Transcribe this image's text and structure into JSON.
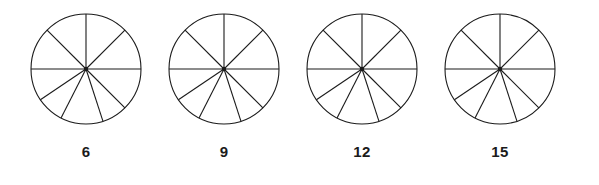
{
  "worksheet": {
    "background_color": "#ffffff",
    "stroke_color": "#1b1b1b",
    "label_color": "#1b1b1b"
  },
  "figures": [
    {
      "label": "6",
      "shape": "circle",
      "sector_count": 9,
      "spoke_angles_deg": [
        0,
        45,
        90,
        135,
        162,
        207,
        236,
        270,
        315
      ]
    },
    {
      "label": "9",
      "shape": "circle",
      "sector_count": 9,
      "spoke_angles_deg": [
        0,
        45,
        90,
        135,
        162,
        207,
        236,
        270,
        315
      ]
    },
    {
      "label": "12",
      "shape": "circle",
      "sector_count": 9,
      "spoke_angles_deg": [
        0,
        45,
        90,
        135,
        162,
        207,
        236,
        270,
        315
      ]
    },
    {
      "label": "15",
      "shape": "circle",
      "sector_count": 9,
      "spoke_angles_deg": [
        0,
        45,
        90,
        135,
        162,
        207,
        236,
        270,
        315
      ]
    }
  ],
  "geometry": {
    "circle_radius": 55,
    "center_x": 59,
    "center_y": 63,
    "center_dot_radius": 2.2,
    "stroke_width": 1.1
  }
}
